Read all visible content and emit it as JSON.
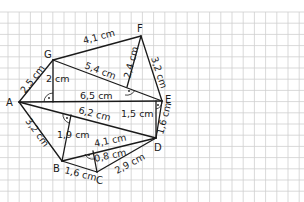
{
  "figure": {
    "type": "polygon-area-decomposition",
    "background": "grid paper",
    "grid": {
      "spacing_px": 11.2,
      "offset_x": 8,
      "offset_y": 12,
      "color": "#cfcfcf"
    },
    "stroke_color": "#1a1a1a"
  },
  "vertices": {
    "A": {
      "label": "A",
      "x": 19,
      "y": 102
    },
    "B": {
      "label": "B",
      "x": 62,
      "y": 161
    },
    "C": {
      "label": "C",
      "x": 97,
      "y": 172
    },
    "D": {
      "label": "D",
      "x": 156,
      "y": 138
    },
    "E": {
      "label": "E",
      "x": 162,
      "y": 101
    },
    "F": {
      "label": "F",
      "x": 141,
      "y": 36
    },
    "G": {
      "label": "G",
      "x": 53,
      "y": 60
    }
  },
  "measurements": {
    "AG": "2,5 cm",
    "GF": "4,1 cm",
    "FE": "3,2 cm",
    "G_height": "2 cm",
    "GE": "5,4 cm",
    "F_height": "2,4 cm",
    "AE": "6,5 cm",
    "AD": "6,2 cm",
    "D_height": "1,5 cm",
    "ED": "1,6 cm",
    "AB": "3,2 cm",
    "B_height": "1,9 cm",
    "BD": "4,1 cm",
    "C_height": "0,8 cm",
    "BC": "1,6 cm",
    "CD": "2,9 cm"
  }
}
